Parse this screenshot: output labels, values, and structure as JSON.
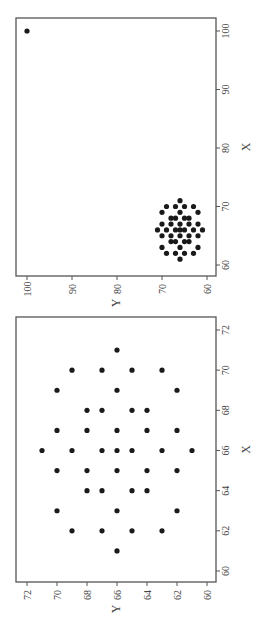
{
  "figure": {
    "rotation": "90deg counter-clockwise",
    "background": "#ffffff",
    "frame_color": "#555555",
    "point_color": "#1a1a1a",
    "text_color": "#444444"
  },
  "chart_data": [
    {
      "type": "scatter",
      "title": "",
      "xlabel": "X",
      "ylabel": "Y",
      "xlim": [
        58,
        102
      ],
      "ylim": [
        58,
        102
      ],
      "xticks": [
        60,
        70,
        80,
        90,
        100
      ],
      "yticks": [
        60,
        70,
        80,
        90,
        100
      ],
      "grid": false,
      "legend": null,
      "annotations": [
        "outlier point at (100, 100)"
      ],
      "frame": {
        "left": 16,
        "top": 18,
        "right": 216,
        "bottom": 276
      },
      "screen_map": {
        "x_val_at_top": 100,
        "x_top_px": 31,
        "x_val_at_bottom": 60,
        "x_bottom_px": 265,
        "y_val_at_left": 100,
        "y_left_px": 27,
        "y_val_at_right": 60,
        "y_right_px": 207
      },
      "points": [
        [
          71,
          66
        ],
        [
          70,
          69
        ],
        [
          70,
          67
        ],
        [
          70,
          65
        ],
        [
          70,
          63
        ],
        [
          69,
          70
        ],
        [
          69,
          66
        ],
        [
          69,
          62
        ],
        [
          68,
          68
        ],
        [
          68,
          67
        ],
        [
          68,
          65
        ],
        [
          68,
          64
        ],
        [
          67,
          70
        ],
        [
          67,
          68
        ],
        [
          67,
          66
        ],
        [
          67,
          64
        ],
        [
          67,
          62
        ],
        [
          66,
          71
        ],
        [
          66,
          69
        ],
        [
          66,
          67
        ],
        [
          66,
          66
        ],
        [
          66,
          65
        ],
        [
          66,
          63
        ],
        [
          66,
          61
        ],
        [
          65,
          70
        ],
        [
          65,
          68
        ],
        [
          65,
          66
        ],
        [
          65,
          64
        ],
        [
          65,
          62
        ],
        [
          64,
          68
        ],
        [
          64,
          67
        ],
        [
          64,
          65
        ],
        [
          64,
          64
        ],
        [
          63,
          70
        ],
        [
          63,
          66
        ],
        [
          63,
          62
        ],
        [
          62,
          69
        ],
        [
          62,
          67
        ],
        [
          62,
          65
        ],
        [
          62,
          63
        ],
        [
          61,
          66
        ],
        [
          100,
          100
        ]
      ]
    },
    {
      "type": "scatter",
      "title": "",
      "xlabel": "X",
      "ylabel": "Y",
      "xlim": [
        59.5,
        72.5
      ],
      "ylim": [
        59.5,
        72.5
      ],
      "xticks": [
        60,
        62,
        64,
        66,
        68,
        70,
        72
      ],
      "yticks": [
        60,
        62,
        64,
        66,
        68,
        70,
        72
      ],
      "grid": false,
      "legend": null,
      "annotations": [],
      "frame": {
        "left": 16,
        "top": 317,
        "right": 216,
        "bottom": 582
      },
      "screen_map": {
        "x_val_at_top": 72,
        "x_top_px": 330,
        "x_val_at_bottom": 60,
        "x_bottom_px": 571,
        "y_val_at_left": 72,
        "y_left_px": 27,
        "y_val_at_right": 60,
        "y_right_px": 207
      },
      "points": [
        [
          71,
          66
        ],
        [
          70,
          69
        ],
        [
          70,
          67
        ],
        [
          70,
          65
        ],
        [
          70,
          63
        ],
        [
          69,
          70
        ],
        [
          69,
          66
        ],
        [
          69,
          62
        ],
        [
          68,
          68
        ],
        [
          68,
          67
        ],
        [
          68,
          65
        ],
        [
          68,
          64
        ],
        [
          67,
          70
        ],
        [
          67,
          68
        ],
        [
          67,
          66
        ],
        [
          67,
          64
        ],
        [
          67,
          62
        ],
        [
          66,
          71
        ],
        [
          66,
          69
        ],
        [
          66,
          67
        ],
        [
          66,
          66
        ],
        [
          66,
          65
        ],
        [
          66,
          63
        ],
        [
          66,
          61
        ],
        [
          65,
          70
        ],
        [
          65,
          68
        ],
        [
          65,
          66
        ],
        [
          65,
          64
        ],
        [
          65,
          62
        ],
        [
          64,
          68
        ],
        [
          64,
          67
        ],
        [
          64,
          65
        ],
        [
          64,
          64
        ],
        [
          63,
          70
        ],
        [
          63,
          66
        ],
        [
          63,
          62
        ],
        [
          62,
          69
        ],
        [
          62,
          67
        ],
        [
          62,
          65
        ],
        [
          62,
          63
        ],
        [
          61,
          66
        ]
      ]
    }
  ],
  "labels": {
    "top_panel": {
      "xlabel": "X",
      "ylabel": "Y"
    },
    "bottom_panel": {
      "xlabel": "X",
      "ylabel": "Y"
    }
  }
}
